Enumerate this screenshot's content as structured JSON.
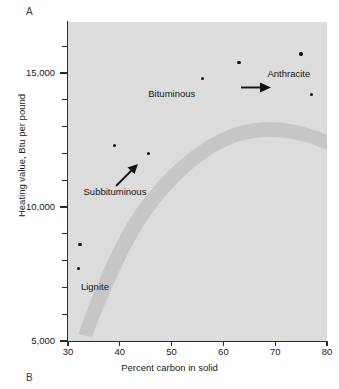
{
  "figure": {
    "panel_top_letter": "A",
    "panel_bottom_letter": "B"
  },
  "chart_data": {
    "type": "scatter",
    "title": "",
    "xlabel": "Percent carbon in solid",
    "ylabel": "Heating value, Btu per pound",
    "xlim": [
      30,
      80
    ],
    "ylim": [
      5000,
      16900
    ],
    "xticks": [
      30,
      40,
      50,
      60,
      70,
      80
    ],
    "xtick_labels": [
      "30",
      "40",
      "50",
      "60",
      "70",
      "80"
    ],
    "yticks": [
      5000,
      10000,
      15000
    ],
    "ytick_labels": [
      "5,000",
      "10,000",
      "15,000"
    ],
    "yticks_minor": [
      6000,
      7000,
      8000,
      9000,
      11000,
      12000,
      13000,
      14000,
      16000
    ],
    "grid": false,
    "legend": "none",
    "plot_background": "#dcdcdc",
    "band_color": "#c2c2c2",
    "point_color": "#111111",
    "x": [
      32.0,
      32.3,
      39.0,
      45.5,
      56.0,
      63.0,
      75.0,
      77.0
    ],
    "y": [
      7700,
      8600,
      12300,
      12000,
      14800,
      15400,
      15700,
      14200
    ],
    "points": [
      {
        "x": 32.0,
        "y": 7700
      },
      {
        "x": 32.3,
        "y": 8600
      },
      {
        "x": 39.0,
        "y": 12300
      },
      {
        "x": 45.5,
        "y": 12000
      },
      {
        "x": 56.0,
        "y": 14800
      },
      {
        "x": 63.0,
        "y": 15400
      },
      {
        "x": 75.0,
        "y": 15700
      },
      {
        "x": 77.0,
        "y": 14200
      }
    ],
    "trend_band": {
      "description": "Shaded rank-progression band rising from lignite through subbituminous and bituminous, peaking then declining toward anthracite",
      "path_points": [
        {
          "x": 32.0,
          "y": 7100
        },
        {
          "x": 36.0,
          "y": 9600
        },
        {
          "x": 42.0,
          "y": 12100
        },
        {
          "x": 48.0,
          "y": 13700
        },
        {
          "x": 55.0,
          "y": 14900
        },
        {
          "x": 62.0,
          "y": 15500
        },
        {
          "x": 68.0,
          "y": 15600
        },
        {
          "x": 74.0,
          "y": 15300
        },
        {
          "x": 80.0,
          "y": 14700
        }
      ]
    },
    "annotations": [
      {
        "text": "Lignite",
        "x": 32.5,
        "y": 7000,
        "name": "lignite"
      },
      {
        "text": "Subbituminous",
        "x": 33.0,
        "y": 10550,
        "name": "subbituminous"
      },
      {
        "text": "Bituminous",
        "x": 45.5,
        "y": 14200,
        "name": "bituminous"
      },
      {
        "text": "Anthracite",
        "x": 68.5,
        "y": 14950,
        "name": "anthracite"
      }
    ],
    "arrows": [
      {
        "name": "lower-direction-arrow",
        "x_from": 41.0,
        "y_from": 11450,
        "x_to": 43.5,
        "y_to": 12250
      },
      {
        "name": "upper-direction-arrow",
        "x_from": 64.5,
        "y_from": 15500,
        "x_to": 68.5,
        "y_to": 15500
      }
    ]
  }
}
